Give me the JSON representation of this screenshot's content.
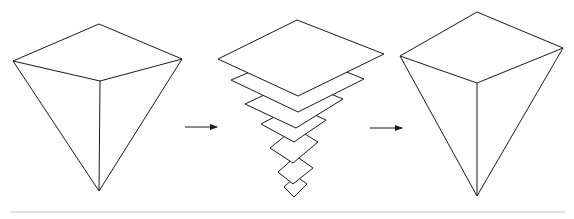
{
  "diagram": {
    "type": "process-illustration",
    "stroke_color": "#1a1a1a",
    "rule_color": "#d8d8d8",
    "stages": [
      {
        "name": "pyramid-start",
        "vertices": {
          "top": [
            99,
            24
          ],
          "left": [
            13,
            61
          ],
          "right": [
            182,
            59
          ],
          "front": [
            100,
            81
          ],
          "apex": [
            99,
            191
          ]
        }
      },
      {
        "name": "layered-slices",
        "layers": [
          {
            "top": [
              297,
              20
            ],
            "left": [
              218,
              59
            ],
            "right": [
              384,
              54
            ],
            "bottom": [
              298,
              96
            ]
          },
          {
            "left": [
              231,
              80
            ],
            "right": [
              364,
              79
            ],
            "bottom": [
              298,
              112
            ]
          },
          {
            "left": [
              245,
              104
            ],
            "right": [
              343,
              99
            ],
            "bottom": [
              296,
              128
            ]
          },
          {
            "left": [
              261,
              124
            ],
            "right": [
              326,
              120
            ],
            "bottom": [
              294,
              142
            ]
          },
          {
            "left": [
              270,
              148
            ],
            "right": [
              318,
              142
            ],
            "bottom": [
              293,
              163
            ]
          },
          {
            "left": [
              278,
              172
            ],
            "right": [
              313,
              168
            ],
            "bottom": [
              293,
              184
            ]
          },
          {
            "left": [
              284,
              187
            ],
            "right": [
              307,
              184
            ],
            "bottom": [
              294,
              197
            ]
          }
        ]
      },
      {
        "name": "pyramid-end",
        "vertices": {
          "top": [
            477,
            12
          ],
          "left": [
            400,
            56
          ],
          "right": [
            563,
            48
          ],
          "front": [
            477,
            83
          ],
          "apex": [
            477,
            196
          ]
        }
      }
    ],
    "arrows": [
      {
        "x1": 185,
        "x2": 218,
        "y": 127
      },
      {
        "x1": 370,
        "x2": 403,
        "y": 128
      }
    ],
    "baseline": {
      "x1": 10,
      "x2": 565,
      "y": 212
    }
  }
}
